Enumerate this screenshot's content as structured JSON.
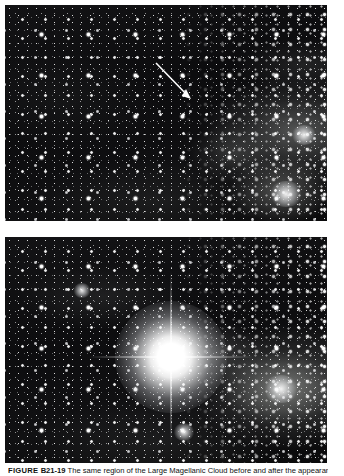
{
  "page": {
    "background_color": "#ffffff",
    "width": 344,
    "height": 476
  },
  "figure": {
    "figure_word": "FIGURE",
    "figure_number": "B21-19",
    "caption_text": "The same region of the Large Magellanic Cloud before and after the appearance of Supernova 1987A.",
    "photo_credit": "Anglo-Australian Telescope Board"
  },
  "plates": [
    {
      "id": "plate-before",
      "name": "before-supernova-plate",
      "label": "Before: progenitor star indicated by arrow",
      "background_color": "#0b0b0c"
    },
    {
      "id": "plate-after",
      "name": "after-supernova-plate",
      "label": "After: Supernova 1987A at peak brightness",
      "background_color": "#0b0b0c"
    }
  ],
  "annotations": {
    "arrow": {
      "name": "progenitor-arrow",
      "label": "arrow pointing to progenitor star",
      "color": "#ffffff",
      "start_x": 156,
      "start_y": 63,
      "end_x": 186,
      "end_y": 94
    },
    "supernova": {
      "name": "supernova-1987a",
      "label": "Supernova 1987A",
      "center_x": 166,
      "center_y": 120,
      "color": "#ffffff"
    }
  }
}
